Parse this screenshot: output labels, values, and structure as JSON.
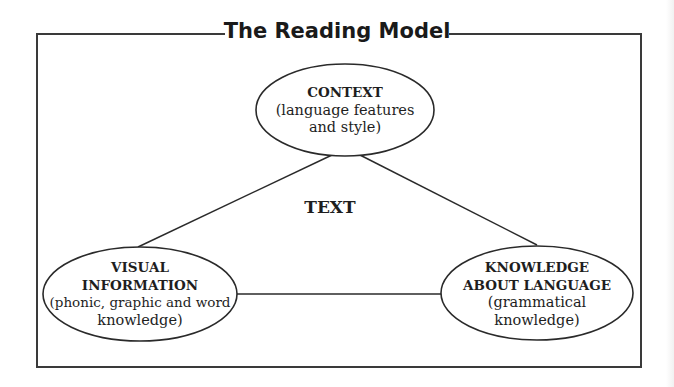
{
  "title": "The Reading Model",
  "center_label": "TEXT",
  "nodes": {
    "context": {
      "heading": "CONTEXT",
      "lines": [
        "(language features",
        "and style)"
      ]
    },
    "visual": {
      "heading_lines": [
        "VISUAL",
        "INFORMATION"
      ],
      "lines": [
        "(phonic, graphic and word",
        "knowledge)"
      ]
    },
    "knowledge": {
      "heading_lines": [
        "KNOWLEDGE",
        "ABOUT LANGUAGE"
      ],
      "lines": [
        "(grammatical",
        "knowledge)"
      ]
    }
  },
  "edges": [
    {
      "from": "visual",
      "to": "context"
    },
    {
      "from": "context",
      "to": "knowledge"
    },
    {
      "from": "visual",
      "to": "knowledge"
    }
  ],
  "colors": {
    "stroke": "#2a2a2a",
    "frame": "#3a3a3a",
    "background": "#ffffff"
  }
}
